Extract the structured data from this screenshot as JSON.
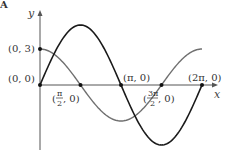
{
  "chart_data": {
    "type": "line",
    "title": "",
    "panel_letter": "A",
    "xlabel": "x",
    "ylabel": "y",
    "x_range": [
      0,
      6.2832
    ],
    "series": [
      {
        "name": "f(x) = 5 sin x",
        "style": "dark",
        "color": "#1a1a1a",
        "amplitude": 5,
        "function": "sin"
      },
      {
        "name": "g(x) = 3 cos x",
        "style": "gray",
        "color": "#707070",
        "amplitude": 3,
        "function": "cos"
      }
    ],
    "marked_points": [
      {
        "label": "(0, 3)",
        "x": 0,
        "y": 3
      },
      {
        "label": "(0, 0)",
        "x": 0,
        "y": 0
      },
      {
        "label": "(π/2, 0)",
        "x": 1.5708,
        "y": 0
      },
      {
        "label": "(π, 0)",
        "x": 3.1416,
        "y": 0
      },
      {
        "label": "(3π/2, 0)",
        "x": 4.7124,
        "y": 0
      },
      {
        "label": "(2π, 0)",
        "x": 6.2832,
        "y": 0
      }
    ],
    "grid": false,
    "legend": "none"
  },
  "labels": {
    "panel": "A",
    "y_axis": "y",
    "x_axis": "x",
    "p03": "(0, 3)",
    "p00": "(0, 0)",
    "ppi": "(π, 0)",
    "p2pi": "(2π, 0)",
    "half_open": "(",
    "half_num": "π",
    "half_den": "2",
    "half_close": ", 0)",
    "three_open": "(",
    "three_num": "3π",
    "three_den": "2",
    "three_close": ", 0)"
  }
}
